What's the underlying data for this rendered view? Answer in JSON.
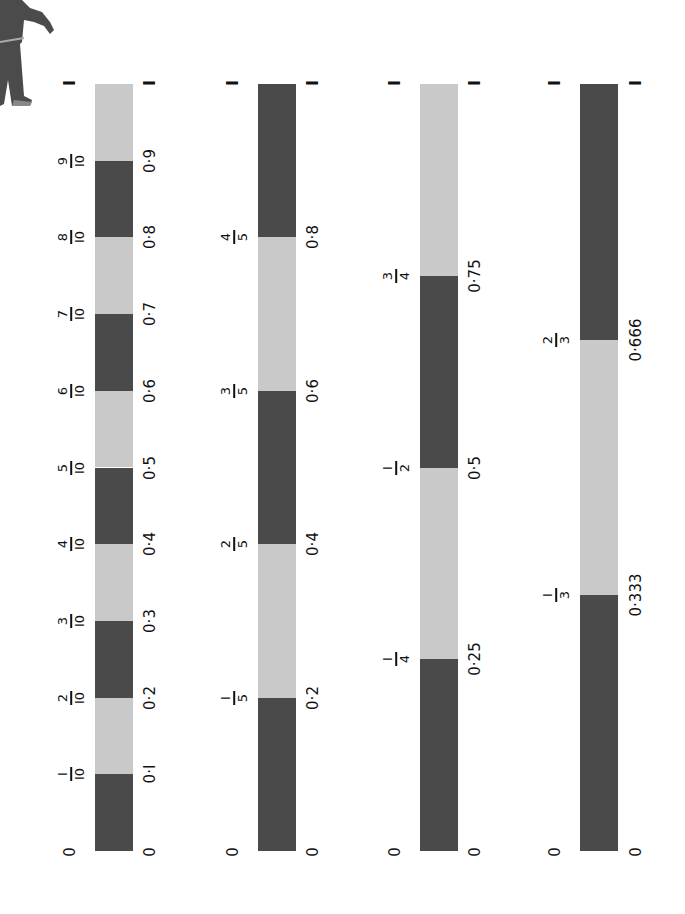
{
  "figure": {
    "icon": "cartoon-child-figure"
  },
  "colors": {
    "dark": "#4a4a4a",
    "light": "#c9c9c9",
    "text": "#111111"
  },
  "geometry": {
    "top": 84,
    "bottom": 851
  },
  "bars": [
    {
      "name": "tenths",
      "x": 95,
      "frac_x": 70,
      "dec_x": 150,
      "start_label": "0",
      "end_label": "I",
      "segments_start_dark": true,
      "denominator_parts": 10,
      "marks": [
        {
          "value": 0.1,
          "num": "I",
          "den": "I0",
          "dec": "0·I"
        },
        {
          "value": 0.2,
          "num": "2",
          "den": "I0",
          "dec": "0·2"
        },
        {
          "value": 0.3,
          "num": "3",
          "den": "I0",
          "dec": "0·3"
        },
        {
          "value": 0.4,
          "num": "4",
          "den": "I0",
          "dec": "0·4"
        },
        {
          "value": 0.5,
          "num": "5",
          "den": "I0",
          "dec": "0·5"
        },
        {
          "value": 0.6,
          "num": "6",
          "den": "I0",
          "dec": "0·6"
        },
        {
          "value": 0.7,
          "num": "7",
          "den": "I0",
          "dec": "0·7"
        },
        {
          "value": 0.8,
          "num": "8",
          "den": "I0",
          "dec": "0·8"
        },
        {
          "value": 0.9,
          "num": "9",
          "den": "I0",
          "dec": "0·9"
        }
      ]
    },
    {
      "name": "fifths",
      "x": 258,
      "frac_x": 233,
      "dec_x": 313,
      "start_label": "0",
      "end_label": "I",
      "segments_start_dark": true,
      "denominator_parts": 5,
      "marks": [
        {
          "value": 0.2,
          "num": "I",
          "den": "5",
          "dec": "0·2"
        },
        {
          "value": 0.4,
          "num": "2",
          "den": "5",
          "dec": "0·4"
        },
        {
          "value": 0.6,
          "num": "3",
          "den": "5",
          "dec": "0·6"
        },
        {
          "value": 0.8,
          "num": "4",
          "den": "5",
          "dec": "0·8"
        }
      ]
    },
    {
      "name": "quarters",
      "x": 420,
      "frac_x": 395,
      "dec_x": 475,
      "start_label": "0",
      "end_label": "I",
      "segments_start_dark": true,
      "denominator_parts": 4,
      "marks": [
        {
          "value": 0.25,
          "num": "I",
          "den": "4",
          "dec": "0·25"
        },
        {
          "value": 0.5,
          "num": "I",
          "den": "2",
          "dec": "0·5"
        },
        {
          "value": 0.75,
          "num": "3",
          "den": "4",
          "dec": "0·75"
        }
      ]
    },
    {
      "name": "thirds",
      "x": 580,
      "frac_x": 555,
      "dec_x": 636,
      "start_label": "0",
      "end_label": "I",
      "segments_start_dark": true,
      "denominator_parts": 3,
      "marks": [
        {
          "value": 0.3333,
          "num": "I",
          "den": "3",
          "dec": "0·333"
        },
        {
          "value": 0.6667,
          "num": "2",
          "den": "3",
          "dec": "0·666"
        }
      ]
    }
  ]
}
